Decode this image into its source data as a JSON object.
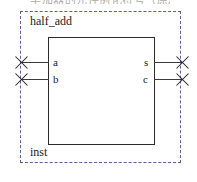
{
  "diagram": {
    "type": "schematic-symbol",
    "caption_remnant": "半加器的元件例化符号（原理图视图）",
    "entity_name": "half_add",
    "instance_name": "inst",
    "colors": {
      "boundary": "#5b5f93",
      "body_outline": "#2b2b2b",
      "wire": "#3a3a3a",
      "text": "#1a1a1a",
      "background": "#ffffff"
    },
    "ports": {
      "inputs": [
        {
          "name": "a",
          "terminal": "x-marker"
        },
        {
          "name": "b",
          "terminal": "x-marker"
        }
      ],
      "outputs": [
        {
          "name": "s",
          "terminal": "x-marker"
        },
        {
          "name": "c",
          "terminal": "x-marker"
        }
      ]
    }
  }
}
